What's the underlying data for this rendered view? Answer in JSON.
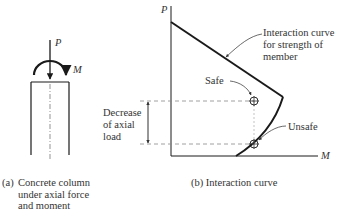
{
  "panel_a": {
    "force_label": "P",
    "moment_label": "M",
    "caption": {
      "prefix": "(a)",
      "lines": [
        "Concrete column",
        "under axial force",
        "and moment"
      ]
    }
  },
  "panel_b": {
    "y_axis_label": "P",
    "x_axis_label": "M",
    "curve_annotation": [
      "Interaction curve",
      "for strength of",
      "member"
    ],
    "safe_label": "Safe",
    "unsafe_label": "Unsafe",
    "decrease_label": [
      "Decrease",
      "of axial",
      "load"
    ],
    "caption": "(b) Interaction curve"
  },
  "colors": {
    "line": "#1a1a1a",
    "dashed": "#888888",
    "text": "#333333"
  }
}
